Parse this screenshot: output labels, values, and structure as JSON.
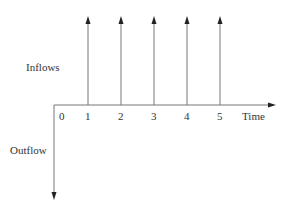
{
  "diagram": {
    "type": "cash-flow-timeline",
    "labels": {
      "inflows": "Inflows",
      "outflow": "Outflow",
      "time": "Time"
    },
    "ticks": [
      "0",
      "1",
      "2",
      "3",
      "4",
      "5"
    ],
    "inflow_periods": [
      1,
      2,
      3,
      4,
      5
    ],
    "outflow_periods": [
      0
    ],
    "colors": {
      "line": "#333333",
      "text": "#333333"
    }
  }
}
